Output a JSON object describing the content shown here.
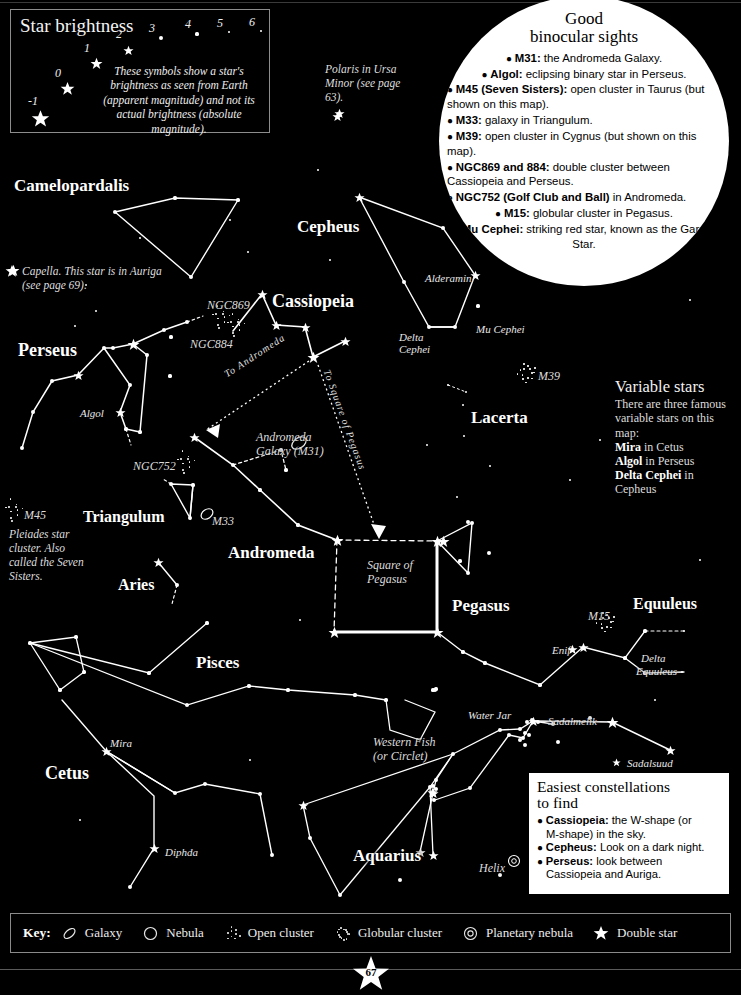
{
  "page": {
    "number": "67",
    "background_color": "#000000",
    "star_color": "#ffffff"
  },
  "brightness_panel": {
    "title": "Star brightness",
    "magnitudes": [
      "-1",
      "0",
      "1",
      "2",
      "3",
      "4",
      "5",
      "6"
    ],
    "caption": "These symbols show a star's brightness as seen from Earth (apparent magnitude) and not its actual brightness (absolute magnitude)."
  },
  "binocular": {
    "title_line1": "Good",
    "title_line2": "binocular sights",
    "items": [
      {
        "bold": "M31:",
        "rest": " the Andromeda Galaxy.",
        "center": true
      },
      {
        "bold": "Algol:",
        "rest": " eclipsing binary star in Perseus.",
        "center": true
      },
      {
        "bold": "M45 (Seven Sisters):",
        "rest": " open cluster in Taurus (but shown on this map).",
        "center": false
      },
      {
        "bold": "M33:",
        "rest": " galaxy in Triangulum.",
        "center": false
      },
      {
        "bold": "M39:",
        "rest": " open cluster in Cygnus (but shown on this map).",
        "center": false
      },
      {
        "bold": "NGC869 and 884:",
        "rest": " double cluster between Cassiopeia and Perseus.",
        "center": false
      },
      {
        "bold": "NGC752 (Golf Club and Ball)",
        "rest": " in Andromeda.",
        "center": false
      },
      {
        "bold": "M15:",
        "rest": " globular cluster in Pegasus.",
        "center": true
      },
      {
        "bold": "Mu Cephei:",
        "rest": " striking red star, known as the Garnet Star.",
        "center": true
      }
    ]
  },
  "variable_stars": {
    "title": "Variable stars",
    "intro": "There are three famous variable stars on this map:",
    "lines": [
      {
        "bold": "Mira",
        "rest": " in Cetus"
      },
      {
        "bold": "Algol",
        "rest": " in Perseus"
      },
      {
        "bold": "Delta Cephei",
        "rest": " in Cepheus"
      }
    ]
  },
  "easiest": {
    "title_line1": "Easiest constellations",
    "title_line2": "to find",
    "items": [
      {
        "bold": "Cassiopeia:",
        "rest": " the W-shape (or",
        "cont": "M-shape) in the sky."
      },
      {
        "bold": "Cepheus:",
        "rest": " Look on a dark night.",
        "cont": ""
      },
      {
        "bold": "Perseus:",
        "rest": " look between",
        "cont": "Cassiopeia and Auriga."
      }
    ]
  },
  "notes": [
    {
      "id": "polaris-note",
      "text": "Polaris in Ursa Minor (see page 63).",
      "x": 325,
      "y": 62,
      "w": 86
    },
    {
      "id": "capella-note",
      "text": "Capella. This star is in Auriga (see page 69).",
      "x": 22,
      "y": 264,
      "w": 155
    },
    {
      "id": "pleiades-note",
      "text": "Pleiades star cluster. Also called the Seven Sisters.",
      "x": 9,
      "y": 527,
      "w": 76
    }
  ],
  "constellations": [
    {
      "name": "Camelopardalis",
      "x": 14,
      "y": 176,
      "size": 17
    },
    {
      "name": "Cepheus",
      "x": 297,
      "y": 217,
      "size": 17
    },
    {
      "name": "Cassiopeia",
      "x": 272,
      "y": 291,
      "size": 18
    },
    {
      "name": "Perseus",
      "x": 18,
      "y": 340,
      "size": 18
    },
    {
      "name": "Lacerta",
      "x": 471,
      "y": 408,
      "size": 17
    },
    {
      "name": "Triangulum",
      "x": 83,
      "y": 508,
      "size": 16
    },
    {
      "name": "Andromeda",
      "x": 228,
      "y": 543,
      "size": 17
    },
    {
      "name": "Aries",
      "x": 118,
      "y": 576,
      "size": 16
    },
    {
      "name": "Pegasus",
      "x": 452,
      "y": 596,
      "size": 17
    },
    {
      "name": "Equuleus",
      "x": 633,
      "y": 595,
      "size": 16
    },
    {
      "name": "Pisces",
      "x": 196,
      "y": 653,
      "size": 17
    },
    {
      "name": "Cetus",
      "x": 45,
      "y": 763,
      "size": 18
    },
    {
      "name": "Aquarius",
      "x": 353,
      "y": 846,
      "size": 17
    }
  ],
  "star_labels": [
    {
      "name": "Algol",
      "x": 80,
      "y": 407
    },
    {
      "name": "Alderamin",
      "x": 425,
      "y": 272
    },
    {
      "name": "Mu Cephei",
      "x": 476,
      "y": 323
    },
    {
      "name": "Delta",
      "x": 399,
      "y": 331
    },
    {
      "name": "Cephei",
      "x": 399,
      "y": 343
    },
    {
      "name": "Enif",
      "x": 552,
      "y": 644
    },
    {
      "name": "Delta",
      "x": 641,
      "y": 652
    },
    {
      "name": "Equuleus",
      "x": 636,
      "y": 665
    },
    {
      "name": "Mira",
      "x": 110,
      "y": 737
    },
    {
      "name": "Diphda",
      "x": 165,
      "y": 846
    },
    {
      "name": "Sadalmelik",
      "x": 548,
      "y": 715
    },
    {
      "name": "Sadalsuud",
      "x": 627,
      "y": 757
    },
    {
      "name": "Water Jar",
      "x": 468,
      "y": 709
    }
  ],
  "deepsky_labels": [
    {
      "name": "NGC869",
      "x": 207,
      "y": 298
    },
    {
      "name": "NGC884",
      "x": 190,
      "y": 337
    },
    {
      "name": "NGC752",
      "x": 133,
      "y": 459
    },
    {
      "name": "M39",
      "x": 538,
      "y": 369
    },
    {
      "name": "M45",
      "x": 24,
      "y": 508
    },
    {
      "name": "M33",
      "x": 212,
      "y": 514
    },
    {
      "name": "M15",
      "x": 588,
      "y": 609
    },
    {
      "name": "Helix",
      "x": 479,
      "y": 861
    }
  ],
  "map_labels": [
    {
      "name": "Andromeda Galaxy (M31)",
      "line1": "Andromeda",
      "line2": "Galaxy (M31)",
      "x": 256,
      "y": 431
    },
    {
      "name": "Square of Pegasus",
      "line1": "Square of",
      "line2": "Pegasus",
      "x": 367,
      "y": 559
    },
    {
      "name": "Western Fish",
      "line1": "Western Fish",
      "line2": "(or Circlet)",
      "x": 373,
      "y": 736
    }
  ],
  "pointer_labels": [
    {
      "text": "To Andromeda",
      "x": 222,
      "y": 370
    },
    {
      "text": "To Square of Pegasus",
      "x": 332,
      "y": 368
    }
  ],
  "key": {
    "label": "Key:",
    "items": [
      {
        "symbol": "galaxy-icon",
        "name": "Galaxy"
      },
      {
        "symbol": "nebula-icon",
        "name": "Nebula"
      },
      {
        "symbol": "open-cluster-icon",
        "name": "Open cluster"
      },
      {
        "symbol": "globular-cluster-icon",
        "name": "Globular cluster"
      },
      {
        "symbol": "planetary-nebula-icon",
        "name": "Planetary nebula"
      },
      {
        "symbol": "double-star-icon",
        "name": "Double star"
      }
    ]
  },
  "chart_data": {
    "type": "scatter",
    "xlabel": "",
    "ylabel": "",
    "stars": [
      {
        "x": 38,
        "y": 117,
        "mag": -1
      },
      {
        "x": 64,
        "y": 87,
        "mag": 0
      },
      {
        "x": 93,
        "y": 60,
        "mag": 1
      },
      {
        "x": 126,
        "y": 45,
        "mag": 2
      },
      {
        "x": 160,
        "y": 37,
        "mag": 3
      },
      {
        "x": 196,
        "y": 33,
        "mag": 4
      },
      {
        "x": 229,
        "y": 31,
        "mag": 5
      },
      {
        "x": 261,
        "y": 30,
        "mag": 6
      },
      {
        "x": 339,
        "y": 113,
        "mag": 2
      },
      {
        "x": 175,
        "y": 198,
        "mag": 4
      },
      {
        "x": 115,
        "y": 212,
        "mag": 3
      },
      {
        "x": 238,
        "y": 200,
        "mag": 4
      },
      {
        "x": 191,
        "y": 277,
        "mag": 3
      },
      {
        "x": 13,
        "y": 270,
        "mag": 1
      },
      {
        "x": 96,
        "y": 311,
        "mag": 5
      },
      {
        "x": 75,
        "y": 326,
        "mag": 5
      },
      {
        "x": 104,
        "y": 348,
        "mag": 3
      },
      {
        "x": 113,
        "y": 348,
        "mag": 3
      },
      {
        "x": 133,
        "y": 344,
        "mag": 1
      },
      {
        "x": 164,
        "y": 330,
        "mag": 3
      },
      {
        "x": 187,
        "y": 322,
        "mag": 3
      },
      {
        "x": 147,
        "y": 355,
        "mag": 3
      },
      {
        "x": 78,
        "y": 375,
        "mag": 2
      },
      {
        "x": 52,
        "y": 381,
        "mag": 3
      },
      {
        "x": 33,
        "y": 412,
        "mag": 3
      },
      {
        "x": 22,
        "y": 448,
        "mag": 3
      },
      {
        "x": 130,
        "y": 385,
        "mag": 3
      },
      {
        "x": 120,
        "y": 412,
        "mag": 2
      },
      {
        "x": 126,
        "y": 429,
        "mag": 4
      },
      {
        "x": 140,
        "y": 432,
        "mag": 4
      },
      {
        "x": 171,
        "y": 337,
        "mag": 4
      },
      {
        "x": 170,
        "y": 376,
        "mag": 4
      },
      {
        "x": 262,
        "y": 294,
        "mag": 2
      },
      {
        "x": 276,
        "y": 325,
        "mag": 2
      },
      {
        "x": 305,
        "y": 327,
        "mag": 2
      },
      {
        "x": 313,
        "y": 357,
        "mag": 1
      },
      {
        "x": 345,
        "y": 341,
        "mag": 2
      },
      {
        "x": 359,
        "y": 197,
        "mag": 2
      },
      {
        "x": 443,
        "y": 228,
        "mag": 3
      },
      {
        "x": 475,
        "y": 275,
        "mag": 2
      },
      {
        "x": 404,
        "y": 282,
        "mag": 3
      },
      {
        "x": 455,
        "y": 327,
        "mag": 3
      },
      {
        "x": 429,
        "y": 327,
        "mag": 3
      },
      {
        "x": 478,
        "y": 306,
        "mag": 4
      },
      {
        "x": 448,
        "y": 385,
        "mag": 5
      },
      {
        "x": 466,
        "y": 392,
        "mag": 5
      },
      {
        "x": 463,
        "y": 405,
        "mag": 5
      },
      {
        "x": 464,
        "y": 436,
        "mag": 5
      },
      {
        "x": 427,
        "y": 445,
        "mag": 5
      },
      {
        "x": 490,
        "y": 466,
        "mag": 5
      },
      {
        "x": 457,
        "y": 497,
        "mag": 5
      },
      {
        "x": 468,
        "y": 522,
        "mag": 3
      },
      {
        "x": 489,
        "y": 553,
        "mag": 3
      },
      {
        "x": 460,
        "y": 561,
        "mag": 4
      },
      {
        "x": 443,
        "y": 541,
        "mag": 1
      },
      {
        "x": 194,
        "y": 437,
        "mag": 2
      },
      {
        "x": 233,
        "y": 465,
        "mag": 3
      },
      {
        "x": 260,
        "y": 490,
        "mag": 4
      },
      {
        "x": 298,
        "y": 525,
        "mag": 4
      },
      {
        "x": 337,
        "y": 540,
        "mag": 2
      },
      {
        "x": 286,
        "y": 470,
        "mag": 4
      },
      {
        "x": 281,
        "y": 450,
        "mag": 4
      },
      {
        "x": 171,
        "y": 484,
        "mag": 3
      },
      {
        "x": 193,
        "y": 485,
        "mag": 4
      },
      {
        "x": 190,
        "y": 518,
        "mag": 3
      },
      {
        "x": 158,
        "y": 562,
        "mag": 2
      },
      {
        "x": 177,
        "y": 585,
        "mag": 3
      },
      {
        "x": 337,
        "y": 540,
        "mag": 1
      },
      {
        "x": 437,
        "y": 541,
        "mag": 1
      },
      {
        "x": 437,
        "y": 632,
        "mag": 1
      },
      {
        "x": 334,
        "y": 632,
        "mag": 1
      },
      {
        "x": 472,
        "y": 523,
        "mag": 3
      },
      {
        "x": 468,
        "y": 573,
        "mag": 3
      },
      {
        "x": 463,
        "y": 652,
        "mag": 4
      },
      {
        "x": 485,
        "y": 663,
        "mag": 4
      },
      {
        "x": 540,
        "y": 685,
        "mag": 4
      },
      {
        "x": 583,
        "y": 647,
        "mag": 2
      },
      {
        "x": 645,
        "y": 631,
        "mag": 4
      },
      {
        "x": 625,
        "y": 658,
        "mag": 4
      },
      {
        "x": 645,
        "y": 673,
        "mag": 4
      },
      {
        "x": 684,
        "y": 631,
        "mag": 5
      },
      {
        "x": 682,
        "y": 672,
        "mag": 5
      },
      {
        "x": 30,
        "y": 643,
        "mag": 4
      },
      {
        "x": 76,
        "y": 637,
        "mag": 4
      },
      {
        "x": 84,
        "y": 672,
        "mag": 4
      },
      {
        "x": 60,
        "y": 690,
        "mag": 4
      },
      {
        "x": 149,
        "y": 673,
        "mag": 4
      },
      {
        "x": 207,
        "y": 623,
        "mag": 4
      },
      {
        "x": 187,
        "y": 705,
        "mag": 3
      },
      {
        "x": 249,
        "y": 686,
        "mag": 4
      },
      {
        "x": 288,
        "y": 690,
        "mag": 4
      },
      {
        "x": 355,
        "y": 695,
        "mag": 4
      },
      {
        "x": 386,
        "y": 700,
        "mag": 4
      },
      {
        "x": 106,
        "y": 751,
        "mag": 2
      },
      {
        "x": 175,
        "y": 793,
        "mag": 3
      },
      {
        "x": 205,
        "y": 784,
        "mag": 3
      },
      {
        "x": 154,
        "y": 848,
        "mag": 2
      },
      {
        "x": 130,
        "y": 887,
        "mag": 3
      },
      {
        "x": 272,
        "y": 855,
        "mag": 3
      },
      {
        "x": 260,
        "y": 794,
        "mag": 3
      },
      {
        "x": 500,
        "y": 730,
        "mag": 3
      },
      {
        "x": 520,
        "y": 729,
        "mag": 3
      },
      {
        "x": 525,
        "y": 733,
        "mag": 3
      },
      {
        "x": 527,
        "y": 722,
        "mag": 3
      },
      {
        "x": 529,
        "y": 735,
        "mag": 3
      },
      {
        "x": 520,
        "y": 740,
        "mag": 3
      },
      {
        "x": 538,
        "y": 722,
        "mag": 3
      },
      {
        "x": 525,
        "y": 745,
        "mag": 3
      },
      {
        "x": 553,
        "y": 724,
        "mag": 3
      },
      {
        "x": 532,
        "y": 720,
        "mag": 3
      },
      {
        "x": 509,
        "y": 735,
        "mag": 3
      },
      {
        "x": 533,
        "y": 721,
        "mag": 2
      },
      {
        "x": 523,
        "y": 738,
        "mag": 3
      },
      {
        "x": 453,
        "y": 754,
        "mag": 3
      },
      {
        "x": 430,
        "y": 787,
        "mag": 3
      },
      {
        "x": 436,
        "y": 789,
        "mag": 3
      },
      {
        "x": 470,
        "y": 788,
        "mag": 3
      },
      {
        "x": 420,
        "y": 852,
        "mag": 2
      },
      {
        "x": 432,
        "y": 792,
        "mag": 2
      },
      {
        "x": 433,
        "y": 793,
        "mag": 2
      },
      {
        "x": 435,
        "y": 690,
        "mag": 3
      },
      {
        "x": 436,
        "y": 780,
        "mag": 3
      },
      {
        "x": 433,
        "y": 786,
        "mag": 3
      },
      {
        "x": 434,
        "y": 800,
        "mag": 3
      },
      {
        "x": 433,
        "y": 855,
        "mag": 2
      },
      {
        "x": 433,
        "y": 690,
        "mag": 4
      },
      {
        "x": 436,
        "y": 689,
        "mag": 4
      },
      {
        "x": 670,
        "y": 750,
        "mag": 2
      },
      {
        "x": 612,
        "y": 722,
        "mag": 1
      },
      {
        "x": 590,
        "y": 718,
        "mag": 3
      },
      {
        "x": 558,
        "y": 742,
        "mag": 3
      },
      {
        "x": 303,
        "y": 805,
        "mag": 2
      },
      {
        "x": 310,
        "y": 838,
        "mag": 3
      },
      {
        "x": 340,
        "y": 895,
        "mag": 3
      },
      {
        "x": 400,
        "y": 880,
        "mag": 3
      },
      {
        "x": 500,
        "y": 875,
        "mag": 3
      },
      {
        "x": 330,
        "y": 260,
        "mag": 6
      },
      {
        "x": 248,
        "y": 252,
        "mag": 6
      },
      {
        "x": 86,
        "y": 285,
        "mag": 6
      },
      {
        "x": 140,
        "y": 238,
        "mag": 6
      },
      {
        "x": 230,
        "y": 220,
        "mag": 6
      },
      {
        "x": 318,
        "y": 170,
        "mag": 6
      },
      {
        "x": 600,
        "y": 440,
        "mag": 6
      },
      {
        "x": 570,
        "y": 480,
        "mag": 6
      },
      {
        "x": 655,
        "y": 700,
        "mag": 6
      },
      {
        "x": 300,
        "y": 620,
        "mag": 6
      },
      {
        "x": 250,
        "y": 760,
        "mag": 6
      },
      {
        "x": 80,
        "y": 820,
        "mag": 6
      },
      {
        "x": 620,
        "y": 840,
        "mag": 6
      },
      {
        "x": 700,
        "y": 560,
        "mag": 6
      },
      {
        "x": 690,
        "y": 300,
        "mag": 6
      }
    ]
  }
}
